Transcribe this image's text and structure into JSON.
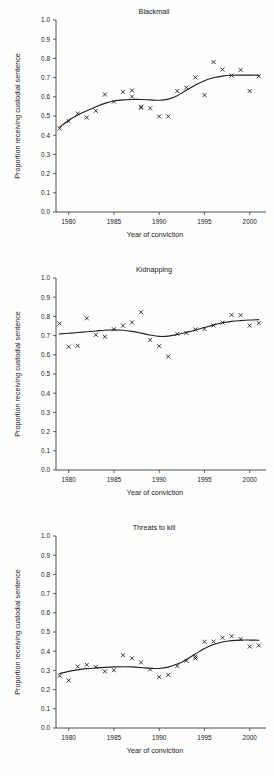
{
  "figure": {
    "background": "#fdfdfd",
    "ink": "#1a1a1a",
    "panel_count": 3
  },
  "axes": {
    "xlabel": "Year of conviction",
    "ylabel": "Proportion receiving custodial sentence",
    "x_ticks": [
      1980,
      1985,
      1990,
      1995,
      2000
    ],
    "y_ticks": [
      "0.0",
      "0.1",
      "0.2",
      "0.3",
      "0.4",
      "0.5",
      "0.6",
      "0.7",
      "0.8",
      "0.9",
      "1.0"
    ],
    "xlim": [
      1978.6,
      2001.8
    ],
    "ylim": [
      0.0,
      1.0
    ],
    "marker": "x",
    "grid": false,
    "legend": "none"
  },
  "chart_data": [
    {
      "type": "scatter",
      "title": "Blackmail",
      "xlabel": "Year of conviction",
      "ylabel": "Proportion receiving custodial sentence",
      "xlim": [
        1978.6,
        2001.8
      ],
      "ylim": [
        0.0,
        1.0
      ],
      "grid": false,
      "x": [
        1979,
        1980,
        1981,
        1982,
        1983,
        1984,
        1985,
        1986,
        1987,
        1987,
        1988,
        1988,
        1989,
        1990,
        1991,
        1992,
        1993,
        1994,
        1995,
        1996,
        1997,
        1998,
        1999,
        2000,
        2001
      ],
      "y": [
        0.435,
        0.473,
        0.513,
        0.492,
        0.527,
        0.612,
        0.575,
        0.626,
        0.601,
        0.633,
        0.548,
        0.543,
        0.54,
        0.498,
        0.498,
        0.63,
        0.648,
        0.701,
        0.609,
        0.781,
        0.742,
        0.711,
        0.74,
        0.63,
        0.707
      ],
      "values": [
        0.435,
        0.473,
        0.513,
        0.492,
        0.527,
        0.612,
        0.575,
        0.626,
        0.601,
        0.633,
        0.548,
        0.543,
        0.54,
        0.498,
        0.498,
        0.63,
        0.648,
        0.701,
        0.609,
        0.781,
        0.742,
        0.711,
        0.74,
        0.63,
        0.707
      ],
      "fit_x": [
        1979,
        1980,
        1981,
        1982,
        1983,
        1984,
        1985,
        1986,
        1987,
        1988,
        1989,
        1990,
        1991,
        1992,
        1993,
        1994,
        1995,
        1996,
        1997,
        1998,
        1999,
        2000,
        2001
      ],
      "fit_y": [
        0.442,
        0.478,
        0.505,
        0.527,
        0.548,
        0.566,
        0.578,
        0.584,
        0.586,
        0.586,
        0.584,
        0.582,
        0.588,
        0.606,
        0.634,
        0.662,
        0.684,
        0.699,
        0.708,
        0.712,
        0.713,
        0.713,
        0.712
      ]
    },
    {
      "type": "scatter",
      "title": "Kidnapping",
      "xlabel": "Year of conviction",
      "ylabel": "Proportion receiving custodial sentence",
      "xlim": [
        1978.6,
        2001.8
      ],
      "ylim": [
        0.0,
        1.0
      ],
      "grid": false,
      "x": [
        1979,
        1980,
        1981,
        1982,
        1983,
        1984,
        1985,
        1986,
        1987,
        1988,
        1989,
        1990,
        1991,
        1992,
        1993,
        1994,
        1995,
        1996,
        1997,
        1998,
        1999,
        2000,
        2001
      ],
      "y": [
        0.763,
        0.642,
        0.647,
        0.79,
        0.704,
        0.694,
        0.733,
        0.752,
        0.769,
        0.822,
        0.678,
        0.645,
        0.591,
        0.709,
        0.714,
        0.732,
        0.735,
        0.753,
        0.768,
        0.808,
        0.806,
        0.752,
        0.765
      ],
      "values": [
        0.763,
        0.642,
        0.647,
        0.79,
        0.704,
        0.694,
        0.733,
        0.752,
        0.769,
        0.822,
        0.678,
        0.645,
        0.591,
        0.709,
        0.714,
        0.732,
        0.735,
        0.753,
        0.768,
        0.808,
        0.806,
        0.752,
        0.765
      ],
      "fit_x": [
        1979,
        1980,
        1981,
        1982,
        1983,
        1984,
        1985,
        1986,
        1987,
        1988,
        1989,
        1990,
        1991,
        1992,
        1993,
        1994,
        1995,
        1996,
        1997,
        1998,
        1999,
        2000,
        2001
      ],
      "fit_y": [
        0.709,
        0.712,
        0.716,
        0.72,
        0.724,
        0.728,
        0.73,
        0.728,
        0.722,
        0.713,
        0.703,
        0.696,
        0.697,
        0.706,
        0.717,
        0.729,
        0.742,
        0.756,
        0.767,
        0.774,
        0.778,
        0.781,
        0.783
      ]
    },
    {
      "type": "scatter",
      "title": "Threats to kill",
      "xlabel": "Year of conviction",
      "ylabel": "Proportion receiving custodial sentence",
      "xlim": [
        1978.6,
        2001.8
      ],
      "ylim": [
        0.0,
        1.0
      ],
      "grid": false,
      "x": [
        1979,
        1980,
        1981,
        1982,
        1983,
        1984,
        1985,
        1986,
        1987,
        1988,
        1989,
        1990,
        1991,
        1992,
        1993,
        1994,
        1994,
        1995,
        1996,
        1997,
        1998,
        1999,
        2000,
        2001
      ],
      "y": [
        0.272,
        0.248,
        0.32,
        0.329,
        0.318,
        0.295,
        0.301,
        0.379,
        0.363,
        0.342,
        0.305,
        0.266,
        0.277,
        0.323,
        0.35,
        0.372,
        0.363,
        0.449,
        0.45,
        0.47,
        0.478,
        0.463,
        0.424,
        0.43
      ],
      "values": [
        0.272,
        0.248,
        0.32,
        0.329,
        0.318,
        0.295,
        0.301,
        0.379,
        0.363,
        0.342,
        0.305,
        0.266,
        0.277,
        0.323,
        0.35,
        0.372,
        0.363,
        0.449,
        0.45,
        0.47,
        0.478,
        0.463,
        0.424,
        0.43
      ],
      "fit_x": [
        1979,
        1980,
        1981,
        1982,
        1983,
        1984,
        1985,
        1986,
        1987,
        1988,
        1989,
        1990,
        1991,
        1992,
        1993,
        1994,
        1995,
        1996,
        1997,
        1998,
        1999,
        2000,
        2001
      ],
      "fit_y": [
        0.283,
        0.295,
        0.303,
        0.309,
        0.313,
        0.316,
        0.318,
        0.319,
        0.318,
        0.315,
        0.311,
        0.31,
        0.317,
        0.333,
        0.356,
        0.386,
        0.414,
        0.435,
        0.448,
        0.455,
        0.458,
        0.458,
        0.457
      ]
    }
  ]
}
